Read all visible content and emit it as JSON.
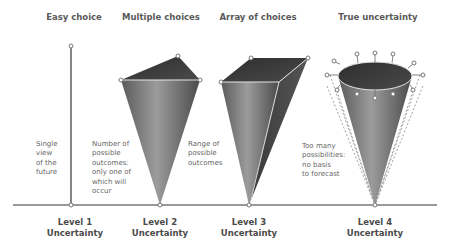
{
  "titles": [
    "Easy choice",
    "Multiple choices",
    "Array of choices",
    "True uncertainty"
  ],
  "descriptions": [
    "Single\nview\nof the\nfuture",
    "Number of\npossible\noutcomes:\nonly one of\nwhich will\noccur",
    "Range of\npossible\noutcomes",
    "Too many\npossibilities:\nno basis\nto forecast"
  ],
  "levels": [
    "Level 1\nUncertainty",
    "Level 2\nUncertainty",
    "Level 3\nUncertainty",
    "Level 4\nUncertainty"
  ],
  "colors": {
    "shape_dark": "#3a3a3a",
    "shape_mid": "#6e6e6e",
    "shape_light": "#9a9a9a",
    "line": "#777777",
    "node": "#8a8a8a"
  }
}
